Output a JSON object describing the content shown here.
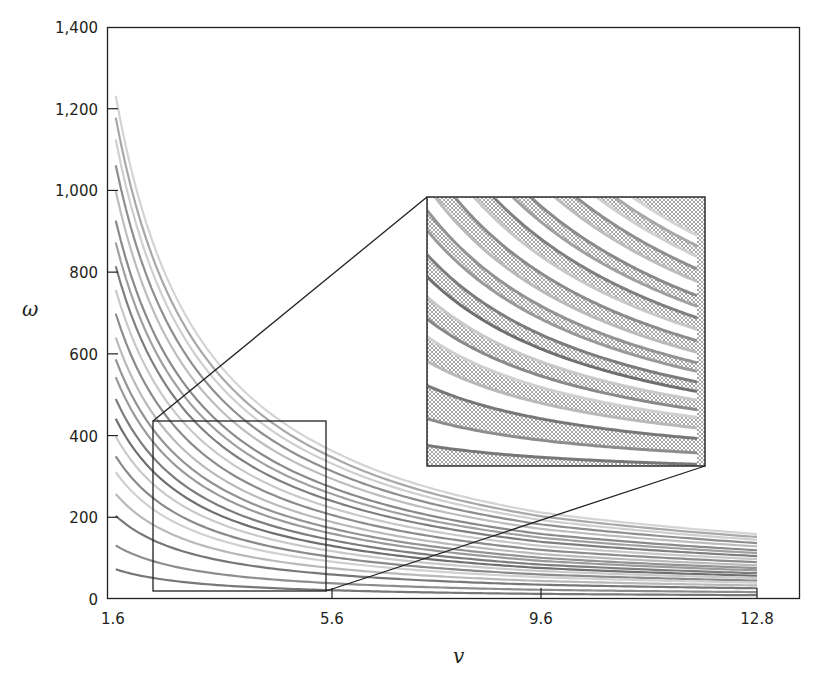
{
  "chart_data": {
    "type": "line",
    "title": "",
    "xlabel": "v",
    "ylabel": "ω",
    "xlim": [
      1.6,
      12.8
    ],
    "ylim": [
      0,
      1400
    ],
    "x_ticks": [
      {
        "value": 1.6,
        "label": "1.6"
      },
      {
        "value": 5.6,
        "label": "5.6"
      },
      {
        "value": 9.6,
        "label": "9.6"
      },
      {
        "value": 12.8,
        "label": "12.8"
      }
    ],
    "y_ticks": [
      {
        "value": 0,
        "label": "0"
      },
      {
        "value": 200,
        "label": "200"
      },
      {
        "value": 400,
        "label": "400"
      },
      {
        "value": 600,
        "label": "600"
      },
      {
        "value": 800,
        "label": "800"
      },
      {
        "value": 1000,
        "label": "1,000"
      },
      {
        "value": 1200,
        "label": "1,200"
      },
      {
        "value": 1400,
        "label": "1,400"
      }
    ],
    "grid": false,
    "legend": null,
    "curve_formula": "omega = k / v",
    "series": [
      {
        "name": "curve-1",
        "start_omega_at_v1.6": 1270,
        "end_omega_at_v12.8": 159,
        "shade": "#d4d4d4"
      },
      {
        "name": "curve-2",
        "start_omega_at_v1.6": 1215,
        "end_omega_at_v12.8": 152,
        "shade": "#a8a8a8"
      },
      {
        "name": "curve-3",
        "start_omega_at_v1.6": 1160,
        "end_omega_at_v12.8": 145,
        "shade": "#cfcfcf"
      },
      {
        "name": "curve-4",
        "start_omega_at_v1.6": 1095,
        "end_omega_at_v12.8": 137,
        "shade": "#8f8f8f"
      },
      {
        "name": "curve-5",
        "start_omega_at_v1.6": 1030,
        "end_omega_at_v12.8": 129,
        "shade": "#bdbdbd"
      },
      {
        "name": "curve-6",
        "start_omega_at_v1.6": 955,
        "end_omega_at_v12.8": 119,
        "shade": "#8a8a8a"
      },
      {
        "name": "curve-7",
        "start_omega_at_v1.6": 900,
        "end_omega_at_v12.8": 112,
        "shade": "#a0a0a0"
      },
      {
        "name": "curve-8",
        "start_omega_at_v1.6": 840,
        "end_omega_at_v12.8": 105,
        "shade": "#7f7f7f"
      },
      {
        "name": "curve-9",
        "start_omega_at_v1.6": 780,
        "end_omega_at_v12.8": 97,
        "shade": "#c8c8c8"
      },
      {
        "name": "curve-10",
        "start_omega_at_v1.6": 720,
        "end_omega_at_v12.8": 90,
        "shade": "#8c8c8c"
      },
      {
        "name": "curve-11",
        "start_omega_at_v1.6": 660,
        "end_omega_at_v12.8": 82,
        "shade": "#bababa"
      },
      {
        "name": "curve-12",
        "start_omega_at_v1.6": 605,
        "end_omega_at_v12.8": 76,
        "shade": "#939393"
      },
      {
        "name": "curve-13",
        "start_omega_at_v1.6": 560,
        "end_omega_at_v12.8": 70,
        "shade": "#9a9a9a"
      },
      {
        "name": "curve-14",
        "start_omega_at_v1.6": 505,
        "end_omega_at_v12.8": 63,
        "shade": "#7d7d7d"
      },
      {
        "name": "curve-15",
        "start_omega_at_v1.6": 455,
        "end_omega_at_v12.8": 57,
        "shade": "#6f6f6f"
      },
      {
        "name": "curve-16",
        "start_omega_at_v1.6": 410,
        "end_omega_at_v12.8": 51,
        "shade": "#c9c9c9"
      },
      {
        "name": "curve-17",
        "start_omega_at_v1.6": 360,
        "end_omega_at_v12.8": 45,
        "shade": "#8a8a8a"
      },
      {
        "name": "curve-18",
        "start_omega_at_v1.6": 320,
        "end_omega_at_v12.8": 40,
        "shade": "#d0d0d0"
      },
      {
        "name": "curve-19",
        "start_omega_at_v1.6": 265,
        "end_omega_at_v12.8": 33,
        "shade": "#b9b9b9"
      },
      {
        "name": "curve-20",
        "start_omega_at_v1.6": 210,
        "end_omega_at_v12.8": 26,
        "shade": "#777777"
      },
      {
        "name": "curve-21",
        "start_omega_at_v1.6": 135,
        "end_omega_at_v12.8": 17,
        "shade": "#8d8d8d"
      },
      {
        "name": "curve-22",
        "start_omega_at_v1.6": 75,
        "end_omega_at_v12.8": 9,
        "shade": "#777777"
      }
    ],
    "annotations": [
      {
        "type": "zoom-box",
        "description": "small rectangle selecting region",
        "v_range": [
          2.3,
          5.4
        ],
        "omega_range": [
          20,
          435
        ]
      },
      {
        "type": "inset",
        "description": "magnified view of selected region with crosshatched bands between curves",
        "connector_lines": 2
      }
    ]
  }
}
